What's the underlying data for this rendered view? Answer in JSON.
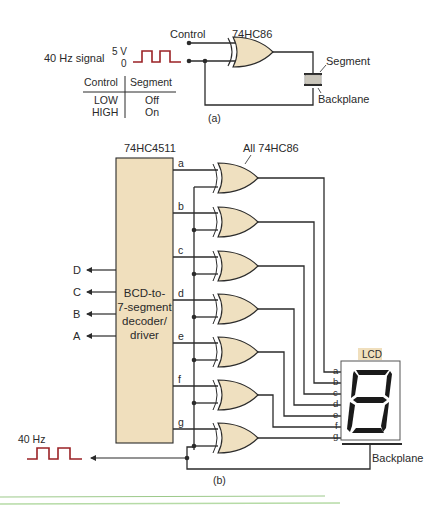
{
  "colors": {
    "wire": "#2b2b2b",
    "gate_fill": "#efe0c0",
    "decoder_fill": "#f0dfbd",
    "signal": "#9b2226",
    "lcd_label_bg": "#f0dfbd",
    "rule_green": "#a8d08d"
  },
  "part_a": {
    "control_label": "Control",
    "gate_label": "74HC86",
    "signal_label": "40 Hz signal",
    "signal_high": "5 V",
    "signal_low": "0",
    "segment_label": "Segment",
    "backplane_label": "Backplane",
    "caption": "(a)",
    "table": {
      "headers": [
        "Control",
        "Segment"
      ],
      "rows": [
        [
          "LOW",
          "Off"
        ],
        [
          "HIGH",
          "On"
        ]
      ]
    }
  },
  "part_b": {
    "decoder_part": "74HC4511",
    "decoder_text": [
      "BCD-to-",
      "7-segment",
      "decoder/",
      "driver"
    ],
    "inputs": [
      "D",
      "C",
      "B",
      "A"
    ],
    "outputs": [
      "a",
      "b",
      "c",
      "d",
      "e",
      "f",
      "g"
    ],
    "gates_label": "All 74HC86",
    "lcd_label": "LCD",
    "lcd_pins": [
      "a",
      "b",
      "c",
      "d",
      "e",
      "f",
      "g"
    ],
    "backplane_label": "Backplane",
    "clock_label": "40 Hz",
    "caption": "(b)"
  }
}
